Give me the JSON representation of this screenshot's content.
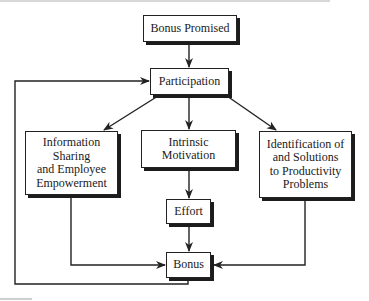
{
  "diagram": {
    "nodes": {
      "bonus_promised": "Bonus Promised",
      "participation": "Participation",
      "info_sharing": "Information Sharing and Employee Empowerment",
      "intrinsic": "Intrinsic Motivation",
      "identification": "Identification of and Solutions to Productivity Problems",
      "effort": "Effort",
      "bonus": "Bonus"
    },
    "info_lines": [
      "Information",
      "Sharing",
      "and Employee",
      "Empowerment"
    ],
    "intrinsic_lines": [
      "Intrinsic",
      "Motivation"
    ],
    "identification_lines": [
      "Identification of",
      "and Solutions",
      "to Productivity",
      "Problems"
    ],
    "edges": [
      {
        "from": "Bonus Promised",
        "to": "Participation"
      },
      {
        "from": "Participation",
        "to": "Information Sharing and Employee Empowerment"
      },
      {
        "from": "Participation",
        "to": "Intrinsic Motivation"
      },
      {
        "from": "Participation",
        "to": "Identification of and Solutions to Productivity Problems"
      },
      {
        "from": "Intrinsic Motivation",
        "to": "Effort"
      },
      {
        "from": "Effort",
        "to": "Bonus"
      },
      {
        "from": "Information Sharing and Employee Empowerment",
        "to": "Bonus"
      },
      {
        "from": "Identification of and Solutions to Productivity Problems",
        "to": "Bonus"
      },
      {
        "from": "Bonus",
        "to": "Participation",
        "type": "feedback"
      }
    ],
    "colors": {
      "line": "#222222",
      "shadow": "#1c1c1c",
      "box_fill": "#ffffff"
    }
  }
}
